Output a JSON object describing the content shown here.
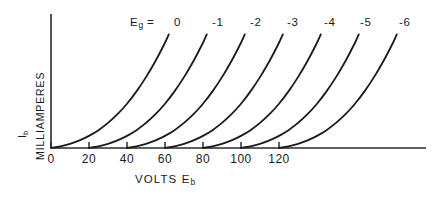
{
  "figure": {
    "background_color": "#ffffff",
    "ink_color": "#1a1a1a",
    "width": 434,
    "height": 198
  },
  "yaxis": {
    "symbol_main": "I",
    "symbol_sub": "b",
    "units_label": "MILLIAMPERES"
  },
  "xaxis": {
    "title_main": "VOLTS  E",
    "title_sub": "b",
    "tick_labels": [
      "0",
      "20",
      "40",
      "60",
      "80",
      "100",
      "120"
    ]
  },
  "legend": {
    "prefix": "Eg  =",
    "values": [
      "0",
      "-1",
      "-2",
      "-3",
      "-4",
      "-5",
      "-6"
    ]
  },
  "chart_data": {
    "type": "line",
    "title": "",
    "subtitle": "",
    "xlabel": "VOLTS Eb",
    "ylabel": "Ib MILLIAMPERES",
    "xlim": [
      0,
      200
    ],
    "ylim": [
      0,
      60
    ],
    "grid": false,
    "legend_position": "top",
    "xticks": [
      0,
      20,
      40,
      60,
      80,
      100,
      120
    ],
    "xticklabels": [
      "0",
      "20",
      "40",
      "60",
      "80",
      "100",
      "120"
    ],
    "yticks": [],
    "yticklabels": [],
    "axis_style": "open-l-shape",
    "series": [
      {
        "name": "Eg = 0",
        "label": "0",
        "x_offset_volts": 0,
        "x": [
          0,
          5,
          10,
          15,
          20,
          25,
          30,
          35,
          40,
          45,
          50,
          55,
          60,
          62
        ],
        "y": [
          0,
          0.9,
          2.2,
          4.0,
          6.4,
          9.4,
          13.2,
          17.8,
          23.3,
          29.8,
          37.3,
          45.8,
          55.4,
          59.8
        ]
      },
      {
        "name": "Eg = -1",
        "label": "-1",
        "x_offset_volts": 20,
        "x": [
          20,
          25,
          30,
          35,
          40,
          45,
          50,
          55,
          60,
          65,
          70,
          75,
          80,
          82
        ],
        "y": [
          0,
          0.9,
          2.2,
          4.0,
          6.4,
          9.4,
          13.2,
          17.8,
          23.3,
          29.8,
          37.3,
          45.8,
          55.4,
          59.8
        ]
      },
      {
        "name": "Eg = -2",
        "label": "-2",
        "x_offset_volts": 40,
        "x": [
          40,
          45,
          50,
          55,
          60,
          65,
          70,
          75,
          80,
          85,
          90,
          95,
          100,
          102
        ],
        "y": [
          0,
          0.9,
          2.2,
          4.0,
          6.4,
          9.4,
          13.2,
          17.8,
          23.3,
          29.8,
          37.3,
          45.8,
          55.4,
          59.8
        ]
      },
      {
        "name": "Eg = -3",
        "label": "-3",
        "x_offset_volts": 60,
        "x": [
          60,
          65,
          70,
          75,
          80,
          85,
          90,
          95,
          100,
          105,
          110,
          115,
          120,
          122
        ],
        "y": [
          0,
          0.9,
          2.2,
          4.0,
          6.4,
          9.4,
          13.2,
          17.8,
          23.3,
          29.8,
          37.3,
          45.8,
          55.4,
          59.8
        ]
      },
      {
        "name": "Eg = -4",
        "label": "-4",
        "x_offset_volts": 80,
        "x": [
          80,
          85,
          90,
          95,
          100,
          105,
          110,
          115,
          120,
          125,
          130,
          135,
          140,
          142
        ],
        "y": [
          0,
          0.9,
          2.2,
          4.0,
          6.4,
          9.4,
          13.2,
          17.8,
          23.3,
          29.8,
          37.3,
          45.8,
          55.4,
          59.8
        ]
      },
      {
        "name": "Eg = -5",
        "label": "-5",
        "x_offset_volts": 100,
        "x": [
          100,
          105,
          110,
          115,
          120,
          125,
          130,
          135,
          140,
          145,
          150,
          155,
          160,
          162
        ],
        "y": [
          0,
          0.9,
          2.2,
          4.0,
          6.4,
          9.4,
          13.2,
          17.8,
          23.3,
          29.8,
          37.3,
          45.8,
          55.4,
          59.8
        ]
      },
      {
        "name": "Eg = -6",
        "label": "-6",
        "x_offset_volts": 120,
        "x": [
          120,
          125,
          130,
          135,
          140,
          145,
          150,
          155,
          160,
          165,
          170,
          175,
          180,
          182
        ],
        "y": [
          0,
          0.9,
          2.2,
          4.0,
          6.4,
          9.4,
          13.2,
          17.8,
          23.3,
          29.8,
          37.3,
          45.8,
          55.4,
          59.8
        ]
      }
    ]
  }
}
